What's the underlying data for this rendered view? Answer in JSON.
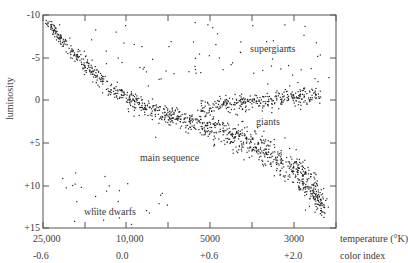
{
  "chart_data": {
    "type": "scatter",
    "title": "",
    "xlabel": "temperature (°K)",
    "xlabel2": "color index",
    "ylabel": "luminosity",
    "ylim": [
      -10,
      15
    ],
    "y_inverted": true,
    "grid": false,
    "y_ticks": [
      "-10",
      "-5",
      "0",
      "+5",
      "+10",
      "+15"
    ],
    "x_tick_labels_temperature": [
      "25,000",
      "10,000",
      "5000",
      "3000"
    ],
    "x_tick_labels_color_index": [
      "-0.6",
      "0.0",
      "+0.6",
      "+2.0"
    ],
    "annotations": [
      "supergiants",
      "giants",
      "main sequence",
      "white dwarfs"
    ],
    "series": [
      {
        "name": "main sequence",
        "description": "diagonal band from upper-left (-10) to lower-right (+14)",
        "points_x_frac": [
          0.0,
          0.1,
          0.2,
          0.35,
          0.5,
          0.65,
          0.8,
          0.9
        ],
        "points_y_lum": [
          -10,
          -5.5,
          -2,
          1.5,
          3.5,
          5,
          8,
          12
        ]
      },
      {
        "name": "giants",
        "description": "horizontal branch around luminosity 0 to +1, color frac 0.55-0.93"
      },
      {
        "name": "supergiants",
        "description": "sparse points near top, luminosity -9 to -2"
      },
      {
        "name": "white dwarfs",
        "description": "sparse points lower-left, luminosity +8 to +14"
      }
    ]
  },
  "axes": {
    "ylabel": "luminosity",
    "y_ticks": [
      {
        "label": "-10",
        "y": 15
      },
      {
        "label": "-5",
        "y": 58
      },
      {
        "label": "0",
        "y": 100
      },
      {
        "label": "+5",
        "y": 143
      },
      {
        "label": "+10",
        "y": 186
      },
      {
        "label": "+15",
        "y": 228
      }
    ],
    "temp_labels": [
      {
        "label": "25,000",
        "x": 43
      },
      {
        "label": "10,000",
        "x": 126
      },
      {
        "label": "5000",
        "x": 210
      },
      {
        "label": "3000",
        "x": 294
      }
    ],
    "color_labels": [
      {
        "label": "-0.6",
        "x": 43
      },
      {
        "label": "0.0",
        "x": 126
      },
      {
        "label": "+0.6",
        "x": 210
      },
      {
        "label": "+2.0",
        "x": 294
      }
    ],
    "temp_title": "temperature (°K)",
    "color_title": "color index"
  },
  "regions": {
    "supergiants": "supergiants",
    "giants": "giants",
    "main_sequence": "main sequence",
    "white_dwarfs": "white dwarfs"
  },
  "colors": {
    "frame": "#555555",
    "dots": "#222222",
    "text": "#3a3a3a"
  }
}
